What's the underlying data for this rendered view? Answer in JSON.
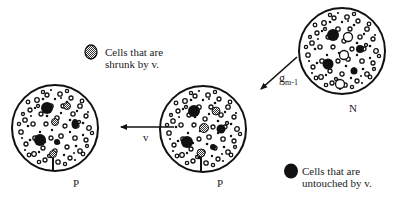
{
  "diagram": {
    "nodes": [
      {
        "id": "left-P",
        "label": "P",
        "cx": 55,
        "cy": 128,
        "r": 43
      },
      {
        "id": "middle-P",
        "label": "P",
        "cx": 203,
        "cy": 129,
        "r": 43
      },
      {
        "id": "N",
        "label": "N",
        "cx": 342,
        "cy": 51,
        "r": 43
      }
    ],
    "edges": [
      {
        "from": "N",
        "to": "middle-P",
        "label": "g",
        "label_sub": "m-1"
      },
      {
        "from": "middle-P",
        "to": "left-P",
        "label": "v"
      }
    ],
    "legend": [
      {
        "marker": "hatched-cell",
        "line1": "Cells that are",
        "line2": "shrunk by v."
      },
      {
        "marker": "solid-cell",
        "line1": "Cells that are",
        "line2": "untouched by v."
      }
    ]
  },
  "colors": {
    "ink": "#111111",
    "hatch": "#888888",
    "background": "#ffffff"
  }
}
